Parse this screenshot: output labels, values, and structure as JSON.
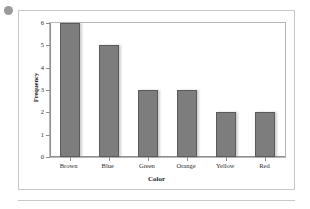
{
  "decor": {
    "bullet_name": "bullet-dot",
    "bullet_color": "#9a9a9a",
    "rule_color": "#c9c9c9"
  },
  "chart_data": {
    "type": "bar",
    "title": "",
    "xlabel": "Color",
    "ylabel": "Frequency",
    "categories": [
      "Brown",
      "Blue",
      "Green",
      "Orange",
      "Yellow",
      "Red"
    ],
    "values": [
      6,
      5,
      3,
      3,
      2,
      2
    ],
    "ylim": [
      0,
      6
    ],
    "yticks": [
      0,
      1,
      2,
      3,
      4,
      5,
      6
    ],
    "ytick_labels": [
      "0",
      "1",
      "2",
      "3",
      "4",
      "5",
      "6"
    ],
    "grid": false,
    "legend": false,
    "bar_fill": "#7d7d7d",
    "bar_edge": "#5a5a5a",
    "axis_color": "#8f8f8f",
    "frame_color": "#b8b8b8"
  }
}
